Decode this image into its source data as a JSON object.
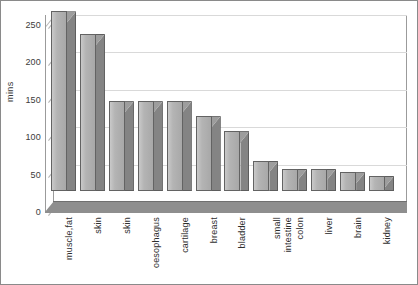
{
  "chart_data": {
    "type": "bar",
    "title": "",
    "subtitle": "",
    "xlabel": "",
    "ylabel": "mins",
    "ylim": [
      0,
      250
    ],
    "yticks": [
      0,
      50,
      100,
      150,
      200,
      250
    ],
    "grid": true,
    "legend": false,
    "legend_position": "none",
    "style": "3d-column",
    "bar_color": "#b4b4b4",
    "bar_side_color": "#848484",
    "bar_edge_color": "#636363",
    "floor_color": "#8e8e8e",
    "gridline_color": "#d9d9d9",
    "categories": [
      "muscle,fat",
      "skin",
      "skin",
      "oesophagus",
      "cartilage",
      "breast",
      "bladder",
      "small intestine",
      "colon",
      "liver",
      "brain",
      "kidney"
    ],
    "category_lines": [
      [
        "muscle,fat"
      ],
      [
        "skin"
      ],
      [
        "skin"
      ],
      [
        "oesophagus"
      ],
      [
        "cartilage"
      ],
      [
        "breast"
      ],
      [
        "bladder"
      ],
      [
        "small",
        "intestine"
      ],
      [
        "colon"
      ],
      [
        "liver"
      ],
      [
        "brain"
      ],
      [
        "kidney"
      ]
    ],
    "values": [
      240,
      210,
      120,
      120,
      120,
      100,
      80,
      40,
      30,
      30,
      25,
      20
    ]
  },
  "axis": {
    "y_title": "mins",
    "tick_0": "0",
    "tick_50": "50",
    "tick_100": "100",
    "tick_150": "150",
    "tick_200": "200",
    "tick_250": "250"
  }
}
